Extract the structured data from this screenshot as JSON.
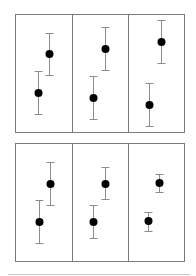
{
  "chart_data": {
    "type": "scatter",
    "title": "",
    "xlabel": "",
    "ylabel": "",
    "grid": false,
    "legend": null,
    "panels": [
      {
        "row": 0,
        "col": 0,
        "points": [
          {
            "x": 38,
            "y": 93,
            "err_low": 114,
            "err_high": 71
          },
          {
            "x": 49,
            "y": 54,
            "err_low": 75,
            "err_high": 33
          }
        ]
      },
      {
        "row": 0,
        "col": 1,
        "points": [
          {
            "x": 93,
            "y": 98,
            "err_low": 119,
            "err_high": 76
          },
          {
            "x": 105,
            "y": 49,
            "err_low": 70,
            "err_high": 27
          }
        ]
      },
      {
        "row": 0,
        "col": 2,
        "points": [
          {
            "x": 149,
            "y": 105,
            "err_low": 126,
            "err_high": 83
          },
          {
            "x": 161,
            "y": 42,
            "err_low": 63,
            "err_high": 20
          }
        ]
      },
      {
        "row": 1,
        "col": 0,
        "points": [
          {
            "x": 39,
            "y": 222,
            "err_low": 243,
            "err_high": 200
          },
          {
            "x": 50,
            "y": 184,
            "err_low": 205,
            "err_high": 162
          }
        ]
      },
      {
        "row": 1,
        "col": 1,
        "points": [
          {
            "x": 93,
            "y": 222,
            "err_low": 238,
            "err_high": 205
          },
          {
            "x": 105,
            "y": 184,
            "err_low": 199,
            "err_high": 167
          }
        ]
      },
      {
        "row": 1,
        "col": 2,
        "points": [
          {
            "x": 148,
            "y": 221,
            "err_low": 231,
            "err_high": 212
          },
          {
            "x": 159,
            "y": 183,
            "err_low": 192,
            "err_high": 174
          }
        ]
      }
    ],
    "layout": {
      "rows": [
        {
          "top": 14,
          "bottom": 132
        },
        {
          "top": 143,
          "bottom": 261
        }
      ],
      "cols": [
        {
          "left": 15,
          "right": 72
        },
        {
          "left": 72,
          "right": 128
        },
        {
          "left": 128,
          "right": 184
        }
      ],
      "marker_radius": 4,
      "cap_half_width": 4,
      "footer_line_y": 274
    }
  }
}
